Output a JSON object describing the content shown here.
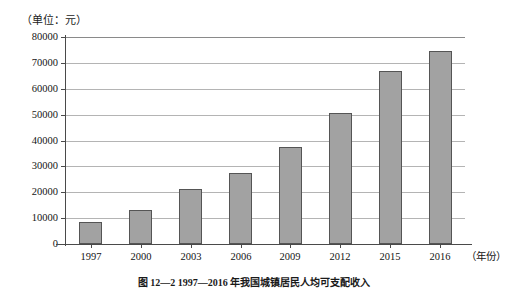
{
  "unit_label": "（单位：元）",
  "x_axis_title": "（年份）",
  "caption": "图 12—2 1997—2016 年我国城镇居民人均可支配收入",
  "chart_data": {
    "type": "bar",
    "title": "",
    "subtitle": "",
    "xlabel": "（年份）",
    "ylabel": "（单位：元）",
    "categories": [
      "1997",
      "2000",
      "2003",
      "2006",
      "2009",
      "2012",
      "2015",
      "2016"
    ],
    "values": [
      8400,
      13000,
      21200,
      27500,
      37500,
      50500,
      67000,
      74500
    ],
    "ylim": [
      0,
      80000
    ],
    "y_ticks": [
      0,
      10000,
      20000,
      30000,
      40000,
      50000,
      60000,
      70000,
      80000
    ],
    "y_tick_labels": [
      "0",
      "10000",
      "20000",
      "30000",
      "40000",
      "50000",
      "60000",
      "70000",
      "80000"
    ],
    "grid": true,
    "legend": false,
    "bar_color": "#a2a2a2",
    "bar_border_color": "#555555",
    "axis_color": "#4a4a4a",
    "grid_color": "#b4b4b4"
  }
}
